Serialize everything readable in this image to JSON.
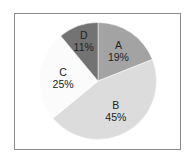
{
  "chart_data": {
    "type": "pie",
    "title": "",
    "categories": [
      "A",
      "B",
      "C",
      "D"
    ],
    "values": [
      19,
      45,
      25,
      11
    ],
    "labels": [
      "A\n19%",
      "B\n45%",
      "C\n25%",
      "D\n11%"
    ],
    "colors": [
      "#a3a3a3",
      "#dcdcdc",
      "#fbfbfb",
      "#737373"
    ],
    "start_angle_deg": 90,
    "direction": "clockwise",
    "legend": "none"
  },
  "slices": [
    {
      "name": "A",
      "pct": "19%",
      "color": "#a3a3a3"
    },
    {
      "name": "B",
      "pct": "45%",
      "color": "#dcdcdc"
    },
    {
      "name": "C",
      "pct": "25%",
      "color": "#fbfbfb"
    },
    {
      "name": "D",
      "pct": "11%",
      "color": "#737373"
    }
  ]
}
